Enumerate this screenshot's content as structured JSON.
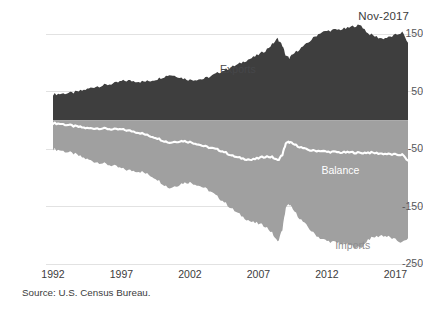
{
  "date_stamp": "Nov-2017",
  "source_note": "Source: U.S. Census Bureau.",
  "labels": {
    "exports": "Exports",
    "balance": "Balance",
    "imports": "Imports"
  },
  "colors": {
    "exports_fill": "#3e3e3e",
    "imports_fill": "#a0a0a0",
    "balance_line": "#ffffff",
    "gridline": "#e2e2e2",
    "axis_text": "#3c3c3c",
    "imports_label": "#8e8e90"
  },
  "chart_data": {
    "type": "area",
    "title": "",
    "subtitle": "",
    "xlabel": "",
    "ylabel": "",
    "xlim": [
      1992,
      2017.92
    ],
    "ylim": [
      -250,
      150
    ],
    "grid": true,
    "legend": "inline-annotations",
    "yticks": [
      150,
      50,
      -50,
      -150,
      -250
    ],
    "ytick_labels": [
      "150",
      "50",
      "-50",
      "-150",
      "-250"
    ],
    "xticks": [
      1992,
      1997,
      2002,
      2007,
      2012,
      2017
    ],
    "xtick_labels": [
      "1992",
      "1997",
      "2002",
      "2007",
      "2012",
      "2017"
    ],
    "units": "billions of U.S. dollars per month",
    "annotations": [
      {
        "text": "Exports",
        "x": 2004.2,
        "y": 88
      },
      {
        "text": "Balance",
        "x": 2011.6,
        "y": -88
      },
      {
        "text": "Imports",
        "x": 2012.6,
        "y": -218
      }
    ],
    "x": [
      1992,
      1992.5,
      1993,
      1993.5,
      1994,
      1994.5,
      1995,
      1995.5,
      1996,
      1996.5,
      1997,
      1997.5,
      1998,
      1998.5,
      1999,
      1999.5,
      2000,
      2000.5,
      2001,
      2001.5,
      2002,
      2002.5,
      2003,
      2003.5,
      2004,
      2004.5,
      2005,
      2005.5,
      2006,
      2006.5,
      2007,
      2007.5,
      2008,
      2008.4,
      2008.75,
      2009,
      2009.25,
      2009.5,
      2010,
      2010.5,
      2011,
      2011.5,
      2012,
      2012.5,
      2013,
      2013.5,
      2014,
      2014.5,
      2015,
      2015.5,
      2016,
      2016.5,
      2017,
      2017.5,
      2017.92
    ],
    "series": [
      {
        "name": "Exports",
        "values": [
          45,
          46,
          47,
          48,
          51,
          54,
          58,
          60,
          62,
          64,
          68,
          69,
          68,
          67,
          68,
          71,
          75,
          79,
          77,
          73,
          70,
          71,
          72,
          76,
          82,
          87,
          92,
          97,
          103,
          108,
          114,
          121,
          132,
          142,
          130,
          112,
          108,
          114,
          124,
          132,
          143,
          152,
          155,
          157,
          158,
          160,
          164,
          165,
          151,
          146,
          142,
          144,
          148,
          153,
          135
        ]
      },
      {
        "name": "Imports",
        "values": [
          -50,
          -52,
          -55,
          -58,
          -63,
          -68,
          -72,
          -74,
          -77,
          -80,
          -84,
          -87,
          -88,
          -90,
          -95,
          -101,
          -110,
          -118,
          -114,
          -109,
          -108,
          -112,
          -117,
          -124,
          -133,
          -142,
          -153,
          -162,
          -170,
          -177,
          -180,
          -184,
          -196,
          -212,
          -190,
          -152,
          -146,
          -155,
          -170,
          -183,
          -196,
          -205,
          -210,
          -212,
          -214,
          -216,
          -220,
          -222,
          -207,
          -203,
          -200,
          -203,
          -208,
          -213,
          -205
        ]
      },
      {
        "name": "Balance",
        "values": [
          -5,
          -6,
          -8,
          -10,
          -12,
          -14,
          -14,
          -14,
          -15,
          -16,
          -16,
          -18,
          -20,
          -23,
          -27,
          -30,
          -35,
          -39,
          -37,
          -36,
          -38,
          -41,
          -45,
          -48,
          -51,
          -55,
          -61,
          -65,
          -67,
          -69,
          -66,
          -63,
          -64,
          -70,
          -60,
          -40,
          -38,
          -41,
          -46,
          -51,
          -53,
          -53,
          -55,
          -55,
          -56,
          -56,
          -56,
          -57,
          -56,
          -57,
          -58,
          -59,
          -60,
          -60,
          -70
        ]
      }
    ]
  }
}
